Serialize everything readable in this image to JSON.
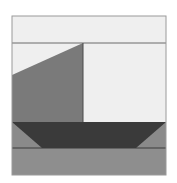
{
  "figure": {
    "frame": {
      "x": 12,
      "y": 16,
      "width": 154,
      "height": 159
    },
    "colors": {
      "background": "#ffffff",
      "sky": "#efefef",
      "sail": "#7a7a7a",
      "mast": "#4a4a4a",
      "hull": "#3a3a3a",
      "water": "#8a8a8a",
      "water_band": "#8e8e8e",
      "lines": "#5a5a5a",
      "frame_border": "#9a9a9a"
    },
    "horizon_line_y": 43,
    "waterline_y": 122,
    "sea_line_y": 148,
    "sail_points": "12,75 83,43 83,122 12,122",
    "hull_points": "12,122 166,122 136,148 42,148"
  }
}
